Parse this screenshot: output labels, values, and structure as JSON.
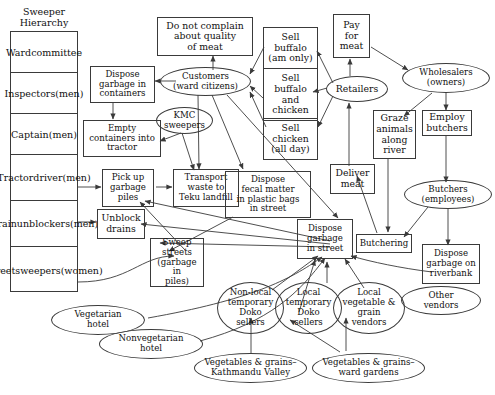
{
  "diagram": {
    "title": "Sweeper Hierarchy",
    "hierarchy": {
      "label": "Sweeper Hierarchy",
      "line1": "Sweeper",
      "line2": "Hierarchy",
      "rows": [
        {
          "id": "ward-committee",
          "lines": [
            "Ward",
            "committee"
          ]
        },
        {
          "id": "inspectors",
          "lines": [
            "Inspectors",
            "(men)"
          ]
        },
        {
          "id": "captain",
          "lines": [
            "Captain",
            "(men)"
          ]
        },
        {
          "id": "tractor-driver",
          "lines": [
            "Tractor",
            "driver",
            "(men)"
          ]
        },
        {
          "id": "drain-unblockers",
          "lines": [
            "Drain",
            "unblockers",
            "(men)"
          ]
        },
        {
          "id": "street-sweepers",
          "lines": [
            "Street",
            "sweepers",
            "(women)"
          ]
        }
      ]
    },
    "nodes": [
      {
        "id": "do-not-complain",
        "shape": "box",
        "lines": [
          "Do not complain",
          "about quality",
          "of meat"
        ]
      },
      {
        "id": "sell-buffalo-am",
        "shape": "box",
        "lines": [
          "Sell",
          "buffalo",
          "(am only)"
        ]
      },
      {
        "id": "pay-for-meat",
        "shape": "box",
        "lines": [
          "Pay",
          "for",
          "meat"
        ]
      },
      {
        "id": "dispose-garbage-containers",
        "shape": "box",
        "lines": [
          "Dispose",
          "garbage in",
          "containers"
        ]
      },
      {
        "id": "customers",
        "shape": "ellipse",
        "lines": [
          "Customers",
          "(ward citizens)"
        ]
      },
      {
        "id": "sell-buffalo-and-chicken",
        "shape": "box",
        "lines": [
          "Sell",
          "buffalo",
          "and",
          "chicken"
        ]
      },
      {
        "id": "retailers",
        "shape": "ellipse",
        "lines": [
          "Retailers"
        ]
      },
      {
        "id": "wholesalers",
        "shape": "ellipse",
        "lines": [
          "Wholesalers",
          "(owners)"
        ]
      },
      {
        "id": "kmc-sweepers",
        "shape": "ellipse",
        "lines": [
          "KMC",
          "sweepers"
        ]
      },
      {
        "id": "sell-chicken",
        "shape": "box",
        "lines": [
          "Sell",
          "chicken",
          "(all day)"
        ]
      },
      {
        "id": "graze-animals",
        "shape": "box",
        "lines": [
          "Graze",
          "animals",
          "along",
          "river"
        ]
      },
      {
        "id": "employ-butchers",
        "shape": "box",
        "lines": [
          "Employ",
          "butchers"
        ]
      },
      {
        "id": "empty-containers",
        "shape": "box",
        "lines": [
          "Empty",
          "containers into",
          "tractor"
        ]
      },
      {
        "id": "pick-up-garbage",
        "shape": "box",
        "lines": [
          "Pick up",
          "garbage",
          "piles"
        ]
      },
      {
        "id": "transport-waste",
        "shape": "box",
        "lines": [
          "Transport",
          "waste to",
          "Teku landfill"
        ]
      },
      {
        "id": "dispose-fecal-matter",
        "shape": "box",
        "lines": [
          "Dispose",
          "fecal matter",
          "in plastic bags",
          "in street"
        ]
      },
      {
        "id": "deliver-meat",
        "shape": "box",
        "lines": [
          "Deliver",
          "meat"
        ]
      },
      {
        "id": "butchers",
        "shape": "ellipse",
        "lines": [
          "Butchers",
          "(employees)"
        ]
      },
      {
        "id": "unblock-drains",
        "shape": "box",
        "lines": [
          "Unblock",
          "drains"
        ]
      },
      {
        "id": "sweep-streets",
        "shape": "box",
        "lines": [
          "Sweep",
          "streets",
          "(garbage in",
          "piles)"
        ]
      },
      {
        "id": "dispose-garbage-street",
        "shape": "box",
        "lines": [
          "Dispose",
          "garbage",
          "in street"
        ]
      },
      {
        "id": "butchering",
        "shape": "box",
        "lines": [
          "Butchering"
        ]
      },
      {
        "id": "dispose-garbage-riverbank",
        "shape": "box",
        "lines": [
          "Dispose",
          "garbage on",
          "riverbank"
        ]
      },
      {
        "id": "other-vendors",
        "shape": "ellipse",
        "lines": [
          "Other",
          "vendors"
        ]
      },
      {
        "id": "nonlocal-doko",
        "shape": "ellipse",
        "lines": [
          "Non-local",
          "temporary",
          "Doko",
          "sellers"
        ]
      },
      {
        "id": "local-doko",
        "shape": "ellipse",
        "lines": [
          "Local",
          "temporary",
          "Doko",
          "sellers"
        ]
      },
      {
        "id": "local-vegetable-grain",
        "shape": "ellipse",
        "lines": [
          "Local",
          "vegetable &",
          "grain",
          "vendors"
        ]
      },
      {
        "id": "vegetarian-hotel",
        "shape": "ellipse",
        "lines": [
          "Vegetarian",
          "hotel"
        ]
      },
      {
        "id": "nonvegetarian-hotel",
        "shape": "ellipse",
        "lines": [
          "Nonvegetarian",
          "hotel"
        ]
      },
      {
        "id": "veg-grains-kathmandu",
        "shape": "ellipse",
        "lines": [
          "Vegetables & grains–",
          "Kathmandu Valley"
        ]
      },
      {
        "id": "veg-grains-ward",
        "shape": "ellipse",
        "lines": [
          "Vegetables & grains–",
          "ward gardens"
        ]
      }
    ],
    "edges": [
      {
        "from": "customers",
        "to": "do-not-complain"
      },
      {
        "from": "customers",
        "to": "dispose-garbage-containers"
      },
      {
        "from": "sell-buffalo-and-chicken",
        "to": "customers"
      },
      {
        "from": "sell-buffalo-am",
        "to": "customers"
      },
      {
        "from": "sell-chicken",
        "to": "customers"
      },
      {
        "from": "retailers",
        "to": "sell-buffalo-am"
      },
      {
        "from": "retailers",
        "to": "sell-buffalo-and-chicken"
      },
      {
        "from": "retailers",
        "to": "sell-chicken"
      },
      {
        "from": "retailers",
        "to": "pay-for-meat"
      },
      {
        "from": "pay-for-meat",
        "to": "wholesalers"
      },
      {
        "from": "wholesalers",
        "to": "graze-animals"
      },
      {
        "from": "wholesalers",
        "to": "employ-butchers"
      },
      {
        "from": "employ-butchers",
        "to": "butchers"
      },
      {
        "from": "graze-animals",
        "to": "butchering"
      },
      {
        "from": "butchers",
        "to": "butchering"
      },
      {
        "from": "butchers",
        "to": "dispose-garbage-riverbank"
      },
      {
        "from": "butchering",
        "to": "deliver-meat"
      },
      {
        "from": "deliver-meat",
        "to": "retailers"
      },
      {
        "from": "dispose-garbage-containers",
        "to": "empty-containers"
      },
      {
        "from": "kmc-sweepers",
        "to": "empty-containers"
      },
      {
        "from": "kmc-sweepers",
        "to": "transport-waste"
      },
      {
        "from": "customers",
        "to": "transport-waste"
      },
      {
        "from": "customers",
        "to": "dispose-fecal-matter"
      },
      {
        "from": "customers",
        "to": "dispose-garbage-street"
      },
      {
        "from": "pick-up-garbage",
        "to": "transport-waste"
      },
      {
        "from": "dispose-fecal-matter",
        "to": "sweep-streets"
      },
      {
        "from": "dispose-garbage-street",
        "to": "pick-up-garbage"
      },
      {
        "from": "dispose-garbage-street",
        "to": "unblock-drains"
      },
      {
        "from": "dispose-garbage-street",
        "to": "sweep-streets"
      },
      {
        "from": "sweep-streets",
        "to": "pick-up-garbage"
      },
      {
        "from": "tractor-driver",
        "to": "pick-up-garbage"
      },
      {
        "from": "drain-unblockers",
        "to": "unblock-drains"
      },
      {
        "from": "street-sweepers",
        "to": "sweep-streets"
      },
      {
        "from": "nonlocal-doko",
        "to": "dispose-garbage-street"
      },
      {
        "from": "local-doko",
        "to": "dispose-garbage-street"
      },
      {
        "from": "local-vegetable-grain",
        "to": "dispose-garbage-street"
      },
      {
        "from": "vegetarian-hotel",
        "to": "dispose-garbage-street"
      },
      {
        "from": "nonvegetarian-hotel",
        "to": "dispose-garbage-street"
      },
      {
        "from": "other-vendors",
        "to": "dispose-garbage-street"
      },
      {
        "from": "veg-grains-kathmandu",
        "to": "nonlocal-doko"
      },
      {
        "from": "veg-grains-ward",
        "to": "local-doko"
      },
      {
        "from": "veg-grains-ward",
        "to": "local-vegetable-grain"
      }
    ],
    "colors": {
      "stroke": "#3a3a3a",
      "text": "#111111",
      "background": "#ffffff"
    }
  }
}
